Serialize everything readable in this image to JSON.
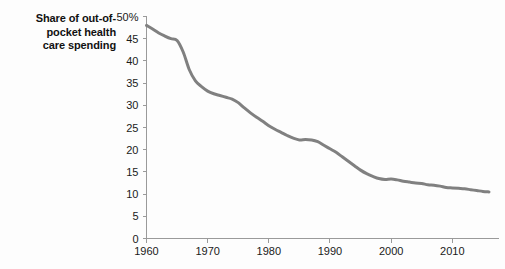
{
  "chart_data": {
    "type": "line",
    "title_lines": [
      "Share of out-of-",
      "pocket health",
      "care spending"
    ],
    "xlabel": "",
    "ylabel": "",
    "xlim": [
      1960,
      2016
    ],
    "ylim": [
      0,
      50
    ],
    "grid": false,
    "legend": "none",
    "line_color": "#808080",
    "axis_color": "#9a9a9a",
    "text_color": "#1a1a1a",
    "background": "#fdfdfd",
    "y_ticks": [
      0,
      5,
      10,
      15,
      20,
      25,
      30,
      35,
      40,
      45,
      50
    ],
    "y_tick_labels": [
      "0",
      "5",
      "10",
      "15",
      "20",
      "25",
      "30",
      "35",
      "40",
      "45",
      "50%"
    ],
    "x_ticks": [
      1960,
      1970,
      1980,
      1990,
      2000,
      2010
    ],
    "x_tick_labels": [
      "1960",
      "1970",
      "1980",
      "1990",
      "2000",
      "2010"
    ],
    "series": [
      {
        "name": "Share of out-of-pocket health care spending",
        "x": [
          1960,
          1961,
          1962,
          1963,
          1964,
          1965,
          1966,
          1967,
          1968,
          1969,
          1970,
          1971,
          1972,
          1973,
          1974,
          1975,
          1976,
          1977,
          1978,
          1979,
          1980,
          1981,
          1982,
          1983,
          1984,
          1985,
          1986,
          1987,
          1988,
          1989,
          1990,
          1991,
          1992,
          1993,
          1994,
          1995,
          1996,
          1997,
          1998,
          1999,
          2000,
          2001,
          2002,
          2003,
          2004,
          2005,
          2006,
          2007,
          2008,
          2009,
          2010,
          2011,
          2012,
          2013,
          2014,
          2015,
          2016
        ],
        "values": [
          48.0,
          47.2,
          46.3,
          45.6,
          45.0,
          44.6,
          42.0,
          38.0,
          35.5,
          34.2,
          33.2,
          32.6,
          32.2,
          31.8,
          31.4,
          30.6,
          29.4,
          28.3,
          27.3,
          26.4,
          25.4,
          24.6,
          23.9,
          23.2,
          22.6,
          22.2,
          22.3,
          22.2,
          21.8,
          21.0,
          20.2,
          19.4,
          18.4,
          17.4,
          16.4,
          15.4,
          14.6,
          14.0,
          13.5,
          13.3,
          13.4,
          13.2,
          12.9,
          12.7,
          12.5,
          12.4,
          12.1,
          12.0,
          11.8,
          11.5,
          11.4,
          11.3,
          11.2,
          11.0,
          10.8,
          10.6,
          10.5
        ]
      }
    ]
  }
}
